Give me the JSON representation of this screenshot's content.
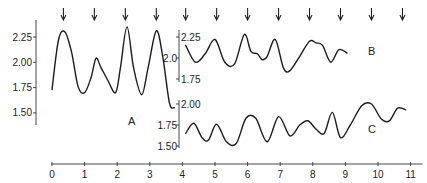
{
  "chart_data": {
    "type": "line",
    "title": "",
    "xlabel": "",
    "ylabel": "",
    "x_ticks": [
      "0",
      "1",
      "2",
      "3",
      "4",
      "5",
      "6",
      "7",
      "8",
      "9",
      "10",
      "11"
    ],
    "xlim": [
      0,
      11
    ],
    "grid": false,
    "legend": "none",
    "annotations": {
      "arrows_x": [
        0.35,
        1.3,
        2.25,
        3.2,
        4.1,
        5.05,
        6.0,
        6.95,
        7.9,
        8.85,
        9.8,
        10.75
      ],
      "arrow_direction": "down"
    },
    "series": [
      {
        "name": "A",
        "y_ticks": [
          "2.25",
          "2.00",
          "1.75",
          "1.50"
        ],
        "ylim": [
          1.45,
          2.35
        ],
        "x": [
          0.0,
          0.2,
          0.4,
          0.6,
          0.8,
          1.0,
          1.2,
          1.35,
          1.5,
          1.7,
          1.95,
          2.1,
          2.3,
          2.5,
          2.75,
          2.95,
          3.2,
          3.4,
          3.6,
          3.75
        ],
        "values": [
          1.73,
          2.22,
          2.3,
          2.1,
          1.76,
          1.7,
          1.85,
          2.04,
          1.95,
          1.83,
          1.7,
          1.95,
          2.35,
          1.95,
          1.68,
          1.95,
          2.31,
          2.05,
          1.6,
          1.55
        ]
      },
      {
        "name": "B",
        "y_ticks": [
          "2.25",
          "2.0",
          "1.75"
        ],
        "ylim": [
          1.7,
          2.35
        ],
        "x": [
          4.1,
          4.4,
          4.7,
          5.0,
          5.3,
          5.6,
          5.9,
          6.1,
          6.3,
          6.45,
          6.6,
          6.85,
          7.1,
          7.3,
          7.6,
          7.9,
          8.1,
          8.3,
          8.55,
          8.8,
          9.05
        ],
        "values": [
          2.15,
          1.95,
          2.05,
          2.22,
          1.95,
          1.93,
          2.28,
          2.08,
          2.05,
          1.98,
          2.02,
          2.22,
          1.88,
          1.85,
          2.02,
          2.2,
          2.18,
          2.15,
          1.95,
          2.1,
          2.06
        ]
      },
      {
        "name": "C",
        "y_ticks": [
          "2.00",
          "1.75",
          "1.50"
        ],
        "ylim": [
          1.45,
          2.05
        ],
        "x": [
          4.1,
          4.35,
          4.6,
          4.8,
          5.05,
          5.35,
          5.65,
          5.95,
          6.25,
          6.6,
          6.95,
          7.3,
          7.6,
          7.85,
          8.1,
          8.35,
          8.6,
          8.85,
          9.15,
          9.5,
          9.8,
          10.1,
          10.35,
          10.6,
          10.85
        ],
        "values": [
          1.65,
          1.77,
          1.6,
          1.57,
          1.76,
          1.55,
          1.53,
          1.83,
          1.83,
          1.55,
          1.85,
          1.62,
          1.75,
          1.8,
          1.7,
          1.65,
          1.9,
          1.6,
          1.75,
          1.98,
          2.0,
          1.82,
          1.8,
          1.95,
          1.93
        ]
      }
    ]
  },
  "labels": {
    "A": "A",
    "B": "B",
    "C": "C"
  }
}
